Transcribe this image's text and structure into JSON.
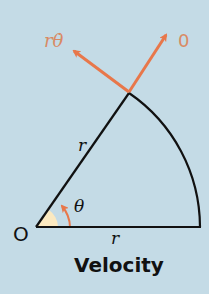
{
  "diagram": {
    "caption": "Velocity",
    "labels": {
      "origin": "O",
      "radius_slant": "r",
      "radius_base": "r",
      "angle": "θ",
      "tangential_velocity": "rθ̇",
      "radial_velocity": "0"
    },
    "colors": {
      "background": "#c4dbe6",
      "arrow": "#e8774a",
      "wedge_fill": "#fbe9c0",
      "line": "#111111",
      "label_arrow": "#d98a64"
    }
  }
}
